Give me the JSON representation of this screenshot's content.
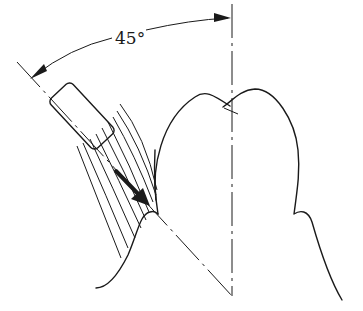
{
  "diagram": {
    "angle_label": "45°",
    "colors": {
      "ink": "#1a1a1a",
      "background": "#ffffff"
    },
    "elements": [
      "tooth-axis-line",
      "brush-axis-line",
      "angle-arc",
      "toothbrush-head",
      "bristles",
      "direction-arrow",
      "tooth-crown",
      "gum-line"
    ]
  }
}
